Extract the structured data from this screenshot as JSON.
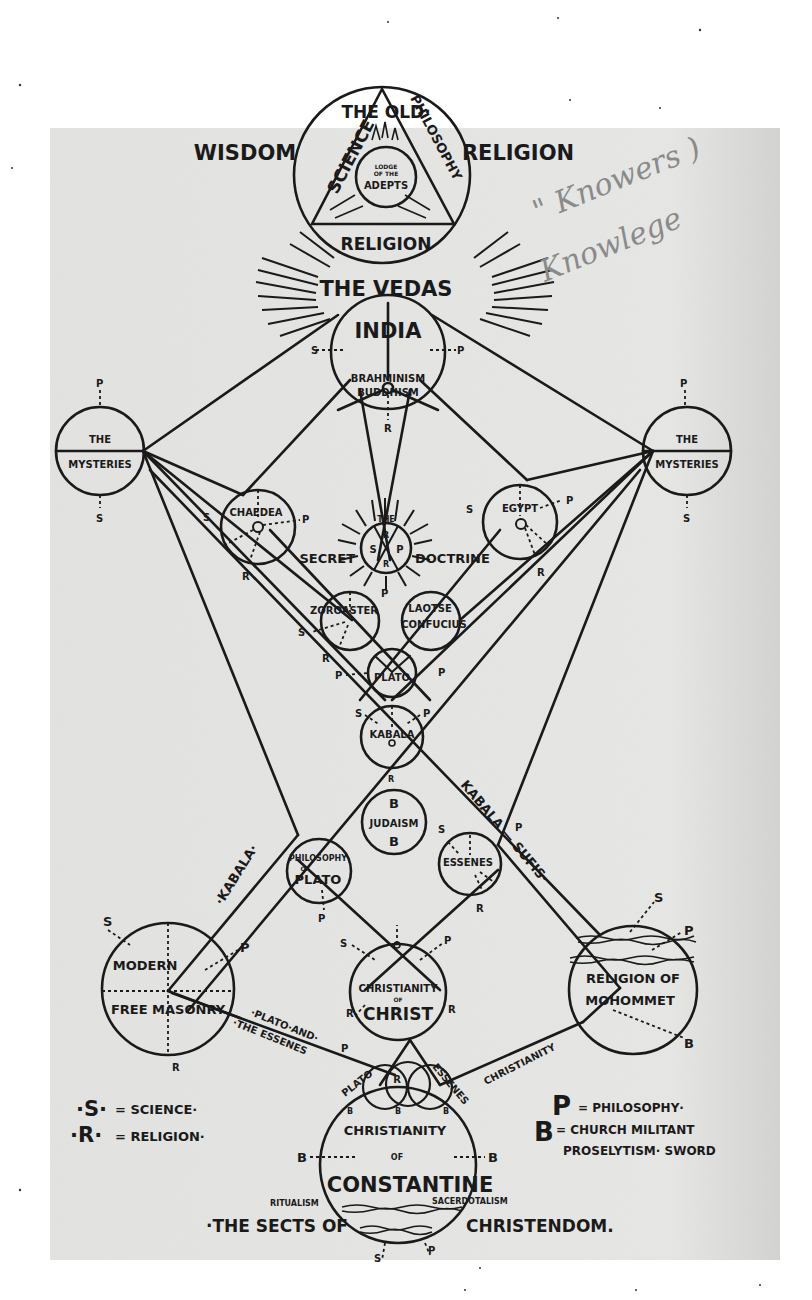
{
  "header": {
    "the_old": "THE OLD·",
    "wisdom": "WISDOM",
    "religion": "RELIGION"
  },
  "top_circle": {
    "science": "SCIENCE",
    "philosophy": "PHILOSOPHY",
    "religion": "RELIGION",
    "lodge_line1": "LODGE",
    "lodge_line2": "OF THE",
    "adepts": "ADEPTS"
  },
  "handwritten_note": {
    "line1": "\" Knowers )",
    "line2": "Knowlege"
  },
  "vedas": "THE VEDAS",
  "india": {
    "title": "INDIA",
    "line1": "BRAHMINISM",
    "line2": "BUDDHISM"
  },
  "mysteries_left": {
    "top": "THE",
    "bottom": "MYSTERIES"
  },
  "mysteries_right": {
    "top": "THE",
    "bottom": "MYSTERIES"
  },
  "chaldea": "CHAEDEA",
  "egypt": "EGYPT",
  "secret_doctrine": {
    "the": "THE",
    "secret": "SECRET",
    "doctrine": "DOCTRINE"
  },
  "zoroaster": "ZOROASTER",
  "laotse": {
    "line1": "LAOTSE",
    "line2": "CONFUCIUS"
  },
  "plato": "PLATO",
  "kabala": "KABALA",
  "judaism": "JUDAISM",
  "philosophy_of_plato": {
    "line1": "PHILOSOPHY",
    "line2": "OF",
    "line3": "PLATO"
  },
  "essenes": "ESSENES",
  "path_labels": {
    "kabala_left": "·KABALA·",
    "kabala_sufis": "KABALA — SUFIS·",
    "plato_and": "·PLATO·AND·",
    "the_essenes": "·THE ESSENES",
    "christianity": "CHRISTIANITY",
    "plato_small": "PLATO",
    "essenes_small": "ESSENES"
  },
  "free_masonry": {
    "line1": "MODERN",
    "line2": "FREE MASONRY"
  },
  "christianity_of_christ": {
    "line1": "CHRISTIANITY",
    "line2": "OF",
    "line3": "CHRIST"
  },
  "mohommet": {
    "line1": "RELIGION OF",
    "line2": "MOHOMMET"
  },
  "constantine": {
    "line1": "CHRISTIANITY",
    "line2": "OF",
    "line3": "CONSTANTINE",
    "ritualism": "RITUALISM",
    "sacerdotalism": "SACERDOTALISM"
  },
  "sects": {
    "left": "·THE SECTS OF",
    "right": "CHRISTENDOM."
  },
  "legend_left": [
    {
      "key": "·S·",
      "value": "= SCIENCE·"
    },
    {
      "key": "·R·",
      "value": "= RELIGION·"
    }
  ],
  "legend_right": [
    {
      "key": "P",
      "value": "= PHILOSOPHY·"
    },
    {
      "key": "B",
      "value": "= CHURCH MILITANT"
    },
    {
      "key": "",
      "value": "PROSELYTISM· SWORD"
    }
  ],
  "markers": {
    "S": "S",
    "P": "P",
    "R": "R",
    "B": "B"
  },
  "colors": {
    "paper": "#e6e6e4",
    "page": "#ffffff",
    "ink": "#1a1a1a",
    "pencil": "#8a8a8a"
  }
}
